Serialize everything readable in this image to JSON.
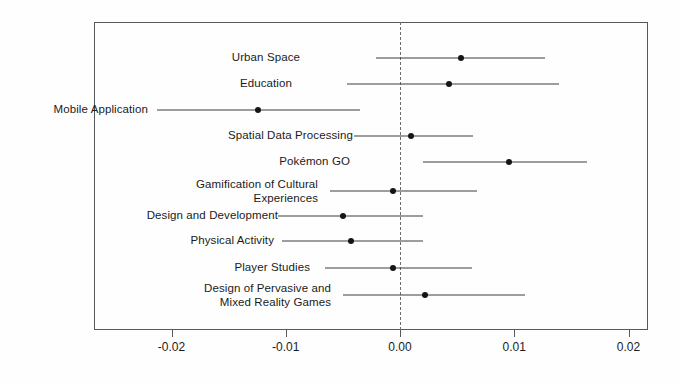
{
  "chart_data": {
    "type": "scatter",
    "plot_style": "forest-plot",
    "title": "",
    "subtitle": "",
    "xlabel": "",
    "ylabel": "",
    "xlim": [
      -0.0263,
      0.0217
    ],
    "xticks": [
      -0.02,
      -0.01,
      0.0,
      0.01,
      0.02
    ],
    "xtick_labels": [
      "-0.02",
      "-0.01",
      "0.00",
      "0.01",
      "0.02"
    ],
    "grid": false,
    "legend": "none",
    "reference_line": {
      "value": 0.0,
      "style": "dashed",
      "color": "#6a6f73"
    },
    "marker_color": "#151515",
    "line_color": "#3a3d40",
    "frame_color": "#555a5e",
    "categories": [
      "Urban Space",
      "Education",
      "Mobile Application",
      "Spatial Data Processing",
      "Pokémon GO",
      "Gamification of Cultural\nExperiences",
      "Design and Development",
      "Physical Activity",
      "Player Studies",
      "Design of Pervasive and\nMixed Reality Games"
    ],
    "points": [
      {
        "label": "Urban Space",
        "estimate": 0.0053,
        "ci_low": -0.0021,
        "ci_high": 0.0127
      },
      {
        "label": "Education",
        "estimate": 0.0043,
        "ci_low": -0.0046,
        "ci_high": 0.0139
      },
      {
        "label": "Mobile Application",
        "estimate": -0.0124,
        "ci_low": -0.0213,
        "ci_high": -0.0035
      },
      {
        "label": "Spatial Data Processing",
        "estimate": 0.001,
        "ci_low": -0.004,
        "ci_high": 0.0064
      },
      {
        "label": "Pokémon GO",
        "estimate": 0.0095,
        "ci_low": 0.002,
        "ci_high": 0.0164
      },
      {
        "label": "Gamification of Cultural\nExperiences",
        "estimate": -0.0006,
        "ci_low": -0.0061,
        "ci_high": 0.0067
      },
      {
        "label": "Design and Development",
        "estimate": -0.005,
        "ci_low": -0.0107,
        "ci_high": 0.002
      },
      {
        "label": "Physical Activity",
        "estimate": -0.0043,
        "ci_low": -0.0103,
        "ci_high": 0.002
      },
      {
        "label": "Player Studies",
        "estimate": -0.0006,
        "ci_low": -0.0066,
        "ci_high": 0.0063
      },
      {
        "label": "Design of Pervasive and\nMixed Reality Games",
        "estimate": 0.0022,
        "ci_low": -0.005,
        "ci_high": 0.0109
      }
    ]
  },
  "geometry": {
    "plot_left_px": 94,
    "plot_right_px": 648,
    "plot_top_px": 22,
    "plot_bottom_px": 330,
    "x_zero_px": 400,
    "px_per_unit": 11425,
    "row_y_px": [
      58,
      84,
      110,
      136,
      162,
      191,
      216,
      241,
      268,
      295
    ],
    "label_right_px": [
      300,
      292,
      148,
      353,
      350,
      318,
      278,
      274,
      310,
      331
    ]
  }
}
